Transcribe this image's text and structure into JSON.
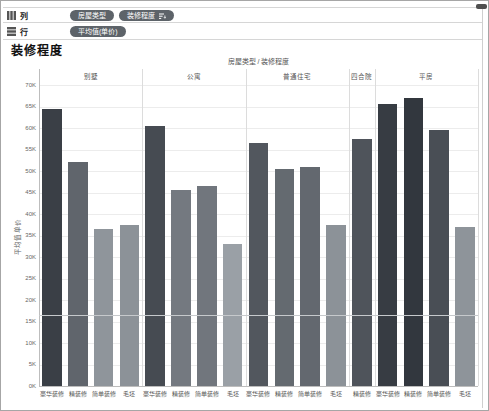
{
  "shelves": {
    "columns": {
      "label": "列",
      "pills": [
        {
          "label": "房屋类型",
          "has_sort_icon": false
        },
        {
          "label": "装修程度",
          "has_sort_icon": true
        }
      ]
    },
    "rows": {
      "label": "行",
      "pills": [
        {
          "label": "平均值(单价)",
          "has_sort_icon": false
        }
      ]
    }
  },
  "sheet_title": "装修程度",
  "pill_color": "#5d6369",
  "chart_data": {
    "type": "bar",
    "title": "房屋类型 / 装修程度",
    "ylabel": "平均值 单价",
    "y_unit": "K",
    "ylim": [
      0,
      70
    ],
    "y_tick_step": 5,
    "grid": true,
    "legend": "none",
    "ref_line_value": 16.6,
    "color_scale": {
      "maps_to": "value",
      "min": 33,
      "max": 67,
      "low_color": "#9aa0a6",
      "high_color": "#32373e"
    },
    "groups": [
      {
        "category": "别墅",
        "bars": [
          {
            "label": "豪华装修",
            "value": 64.5
          },
          {
            "label": "精装修",
            "value": 52
          },
          {
            "label": "简单装修",
            "value": 36.5
          },
          {
            "label": "毛坯",
            "value": 37.5
          }
        ]
      },
      {
        "category": "公寓",
        "bars": [
          {
            "label": "豪华装修",
            "value": 60.5
          },
          {
            "label": "精装修",
            "value": 45.5
          },
          {
            "label": "简单装修",
            "value": 46.5
          },
          {
            "label": "毛坯",
            "value": 33
          }
        ]
      },
      {
        "category": "普通住宅",
        "bars": [
          {
            "label": "豪华装修",
            "value": 56.5
          },
          {
            "label": "精装修",
            "value": 50.5
          },
          {
            "label": "简单装修",
            "value": 51
          },
          {
            "label": "毛坯",
            "value": 37.5
          }
        ]
      },
      {
        "category": "四合院",
        "bars": [
          {
            "label": "精装修",
            "value": 57.5
          }
        ]
      },
      {
        "category": "平房",
        "bars": [
          {
            "label": "豪华装修",
            "value": 65.5
          },
          {
            "label": "精装修",
            "value": 67
          },
          {
            "label": "简单装修",
            "value": 59.5
          },
          {
            "label": "毛坯",
            "value": 37
          }
        ]
      }
    ]
  }
}
